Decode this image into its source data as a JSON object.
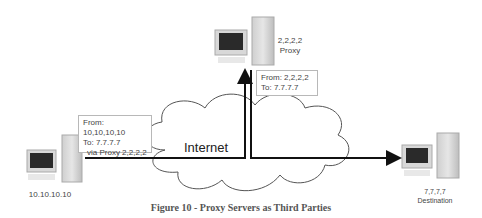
{
  "diagram": {
    "nodes": {
      "source": {
        "ip": "10.10.10.10",
        "extra": "."
      },
      "proxy": {
        "ip": "2,2,2,2",
        "role": "Proxy"
      },
      "destination": {
        "ip": "7,7,7,7",
        "role": "Destination"
      }
    },
    "cloud_label": "Internet",
    "boxes": {
      "source_packet": {
        "line1": "From: 10,10,10,10",
        "line2": "To: 7.7.7.7",
        "line3": "via Proxy 2,2,2,2"
      },
      "proxy_packet": {
        "line1": "From: 2,2,2,2",
        "line2": "To: 7.7.7.7"
      }
    },
    "caption": "Figure 10 - Proxy Servers as Third Parties"
  }
}
